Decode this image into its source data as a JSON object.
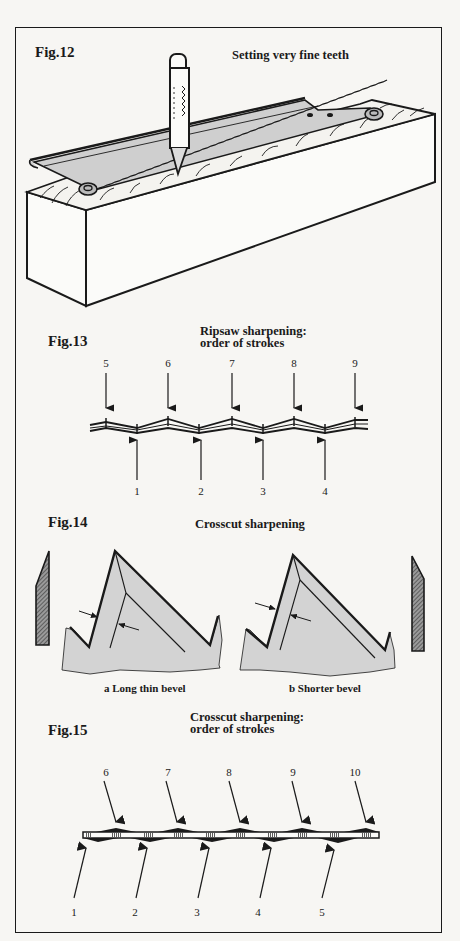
{
  "figures": {
    "fig12": {
      "label": "Fig.12",
      "title": "Setting very fine teeth"
    },
    "fig13": {
      "label": "Fig.13",
      "title_line1": "Ripsaw sharpening:",
      "title_line2": "order of strokes",
      "top_strokes": [
        "5",
        "6",
        "7",
        "8",
        "9"
      ],
      "bottom_strokes": [
        "1",
        "2",
        "3",
        "4"
      ]
    },
    "fig14": {
      "label": "Fig.14",
      "title": "Crosscut sharpening",
      "caption_a": "a Long thin bevel",
      "caption_b": "b Shorter bevel"
    },
    "fig15": {
      "label": "Fig.15",
      "title_line1": "Crosscut sharpening:",
      "title_line2": "order of strokes",
      "top_strokes": [
        "6",
        "7",
        "8",
        "9",
        "10"
      ],
      "bottom_strokes": [
        "1",
        "2",
        "3",
        "4",
        "5"
      ]
    }
  },
  "colors": {
    "paper": "#f7f6f3",
    "ink": "#1a1a1a",
    "steel_fill": "#cfcfcf",
    "tooth_fill": "#d3d3d3"
  }
}
